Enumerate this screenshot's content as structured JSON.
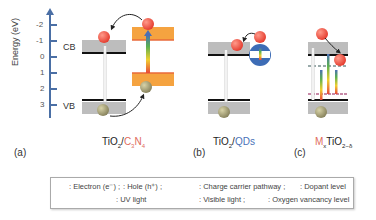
{
  "axis": {
    "label": "Energy (eV)",
    "ticks": [
      "-2",
      "-1",
      "0",
      "1",
      "2",
      "3"
    ],
    "color": "#4a6fa5"
  },
  "bands": {
    "cb": "CB",
    "vb": "VB"
  },
  "panels": [
    {
      "label": "(a)",
      "caption_main": "TiO",
      "caption_sub": "2",
      "caption_slash": "/",
      "caption_accent": "C",
      "caption_accent_sub1": "3",
      "caption_accent_2": "N",
      "caption_accent_sub2": "4",
      "accent_color": "#e06c5c"
    },
    {
      "label": "(b)",
      "caption_main": "TiO",
      "caption_sub": "2",
      "caption_slash": "/",
      "caption_accent": "QDs",
      "accent_color": "#4a72b8"
    },
    {
      "label": "(c)",
      "caption_accent": "M",
      "caption_accent_sub": "x",
      "caption_main": "TiO",
      "caption_sub": "2−δ",
      "accent_color": "#e06c5c"
    }
  ],
  "legend": {
    "row1": [
      {
        "icon": "electron-icon",
        "text": ": Electron (e⁻) ;"
      },
      {
        "icon": "hole-icon",
        "text": ": Hole (h⁺) ;"
      },
      {
        "icon": "curved-arrow-icon",
        "text": ": Charge carrier pathway ;"
      },
      {
        "icon": "dopant-level-icon",
        "text": ": Dopant level"
      }
    ],
    "row2": [
      {
        "icon": "uv-light-arrow-icon",
        "text": ": UV light"
      },
      {
        "icon": "visible-light-arrow-icon",
        "text": ": Visible light ;"
      },
      {
        "icon": "oxygen-vacancy-icon",
        "text": ": Oxygen vancancy level"
      }
    ]
  },
  "colors": {
    "electron": "#ee4b3c",
    "hole": "#9a9670",
    "band_gray": "#b9b9b9",
    "c3n4_orange": "#f5a340",
    "qd_blue": "#3d6cb5"
  }
}
